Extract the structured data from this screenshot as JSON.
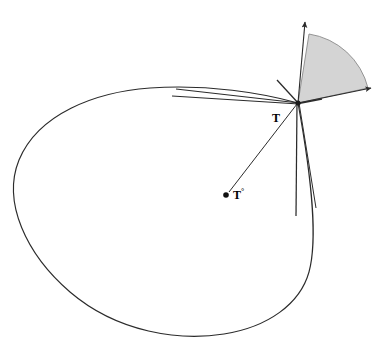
{
  "figure": {
    "background_color": "#ffffff",
    "stroke_color": "#2b2b2b",
    "sector_fill_color": "#d4d4d4",
    "sector_stroke_color": "#8a8a8a",
    "width": 385,
    "height": 350
  },
  "labels": {
    "tangent_point": "T",
    "interior_point_base": "T",
    "interior_point_sup": "°"
  },
  "points": {
    "tangent_point": {
      "x": 298,
      "y": 103,
      "label": "T"
    },
    "interior_point": {
      "x": 227,
      "y": 194,
      "label": "T°"
    }
  },
  "curve": {
    "type": "closed-convex-oval",
    "path": "M 298 103 C 262 93 208 84 150 88 C 95 92 38 114 19 160 C 2 202 26 254 70 292 C 118 333 180 341 224 334 C 268 327 300 304 309 272 C 318 239 312 180 298 103 Z"
  },
  "sector": {
    "description": "shaded normal cone at T",
    "vertex": {
      "x": 298,
      "y": 103
    },
    "radius": 72,
    "start_edge": {
      "x": 311,
      "y": 32
    },
    "end_edge": {
      "x": 368,
      "y": 88
    },
    "path": "M 298 103 L 309 34 A 72 72 0 0 1 368 88 Z"
  },
  "rays": [
    {
      "name": "normal-up-arrow",
      "x1": 298,
      "y1": 103,
      "x2": 305,
      "y2": 22,
      "arrow": true
    },
    {
      "name": "normal-right-arrow",
      "x1": 298,
      "y1": 103,
      "x2": 372,
      "y2": 88,
      "arrow": true
    },
    {
      "name": "tangent-line-left",
      "x1": 298,
      "y1": 103,
      "x2": 176,
      "y2": 89,
      "arrow": false
    },
    {
      "name": "secant-line-left",
      "x1": 298,
      "y1": 103,
      "x2": 172,
      "y2": 96,
      "arrow": false
    },
    {
      "name": "short-tangent-right",
      "x1": 298,
      "y1": 103,
      "x2": 322,
      "y2": 99,
      "arrow": false
    },
    {
      "name": "upper-left-short-ray",
      "x1": 298,
      "y1": 103,
      "x2": 277,
      "y2": 80,
      "arrow": false
    },
    {
      "name": "lower-ray-near-vertical",
      "x1": 298,
      "y1": 103,
      "x2": 296,
      "y2": 216,
      "arrow": false
    },
    {
      "name": "lower-ray-slanted",
      "x1": 298,
      "y1": 103,
      "x2": 316,
      "y2": 208,
      "arrow": false
    },
    {
      "name": "segment-to-interior-point",
      "x1": 298,
      "y1": 103,
      "x2": 227,
      "y2": 194,
      "arrow": false
    }
  ]
}
